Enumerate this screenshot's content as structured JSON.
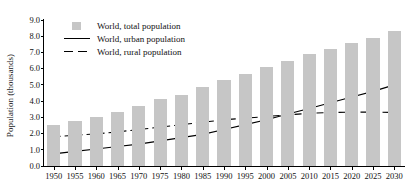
{
  "chart_data": {
    "type": "bar",
    "title": "",
    "xlabel": "",
    "ylabel": "Population (thousands)",
    "ylim": [
      0.0,
      9.0
    ],
    "ytick_values": [
      0.0,
      1.0,
      2.0,
      3.0,
      4.0,
      5.0,
      6.0,
      7.0,
      8.0,
      9.0
    ],
    "ytick_labels": [
      "0.0",
      "1.0",
      "2.0",
      "3.0",
      "4.0",
      "5.0",
      "6.0",
      "7.0",
      "8.0",
      "9.0"
    ],
    "grid": false,
    "legend_position": "top-left",
    "categories": [
      "1950",
      "1955",
      "1960",
      "1965",
      "1970",
      "1975",
      "1980",
      "1985",
      "1990",
      "1995",
      "2000",
      "2005",
      "2010",
      "2015",
      "2020",
      "2025",
      "2030"
    ],
    "series": [
      {
        "name": "World, total population",
        "type": "bar",
        "color": "#c6c6c6",
        "values": [
          2.5,
          2.8,
          3.0,
          3.3,
          3.7,
          4.1,
          4.4,
          4.9,
          5.3,
          5.7,
          6.1,
          6.5,
          6.9,
          7.2,
          7.6,
          7.9,
          8.3
        ]
      },
      {
        "name": "World, urban population",
        "type": "line",
        "style": "solid",
        "color": "#000000",
        "values": [
          0.75,
          0.9,
          1.05,
          1.2,
          1.35,
          1.55,
          1.75,
          1.95,
          2.25,
          2.55,
          2.85,
          3.2,
          3.55,
          3.9,
          4.25,
          4.6,
          5.0
        ]
      },
      {
        "name": "World, rural population",
        "type": "line",
        "style": "dashed",
        "color": "#000000",
        "values": [
          1.8,
          1.9,
          1.98,
          2.1,
          2.25,
          2.4,
          2.55,
          2.7,
          2.85,
          2.95,
          3.05,
          3.15,
          3.25,
          3.3,
          3.32,
          3.32,
          3.3
        ]
      }
    ]
  },
  "legend": {
    "items": [
      {
        "label": "World, total population",
        "marker": "square-swatch"
      },
      {
        "label": "World, urban population",
        "marker": "solid-line"
      },
      {
        "label": "World, rural population",
        "marker": "dashed-line"
      }
    ]
  }
}
